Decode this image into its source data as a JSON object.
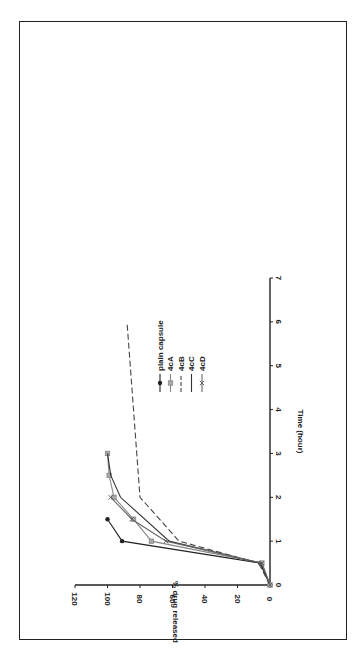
{
  "chart_data": {
    "type": "line",
    "orientation": "rotated-90-ccw",
    "title": "",
    "xlabel": "Time (hour)",
    "ylabel": "% drug released",
    "xlim": [
      0,
      7
    ],
    "ylim": [
      0,
      120
    ],
    "xticks": [
      "0",
      "1",
      "2",
      "3",
      "4",
      "5",
      "6",
      "7"
    ],
    "yticks": [
      "0",
      "20",
      "40",
      "60",
      "80",
      "100",
      "120"
    ],
    "grid": false,
    "legend_position": "right",
    "series": [
      {
        "name": "plain capsule",
        "marker": "circle",
        "color": "#222222",
        "dash": "",
        "points": [
          [
            0,
            0
          ],
          [
            0.5,
            6
          ],
          [
            1,
            91
          ],
          [
            1.5,
            100
          ]
        ]
      },
      {
        "name": "4cA",
        "marker": "square",
        "color": "#888888",
        "dash": "",
        "points": [
          [
            0,
            0
          ],
          [
            0.5,
            5
          ],
          [
            1,
            73
          ],
          [
            1.5,
            84
          ],
          [
            2,
            96
          ],
          [
            2.5,
            99
          ],
          [
            3,
            100
          ]
        ]
      },
      {
        "name": "4cB",
        "marker": "none",
        "color": "#444444",
        "dash": "6,3",
        "points": [
          [
            0,
            0
          ],
          [
            0.5,
            7
          ],
          [
            1,
            56
          ],
          [
            2,
            80
          ],
          [
            3,
            82
          ],
          [
            4,
            84
          ],
          [
            5,
            86
          ],
          [
            6,
            88
          ]
        ]
      },
      {
        "name": "4cC",
        "marker": "none",
        "color": "#333333",
        "dash": "",
        "points": [
          [
            0,
            0
          ],
          [
            0.5,
            6
          ],
          [
            1,
            62
          ],
          [
            2,
            92
          ],
          [
            2.5,
            98
          ],
          [
            3,
            100
          ]
        ]
      },
      {
        "name": "4cD",
        "marker": "x",
        "color": "#666666",
        "dash": "",
        "points": [
          [
            0,
            0
          ],
          [
            0.5,
            5
          ],
          [
            1,
            64
          ],
          [
            1.5,
            85
          ],
          [
            2,
            98
          ]
        ]
      }
    ]
  }
}
